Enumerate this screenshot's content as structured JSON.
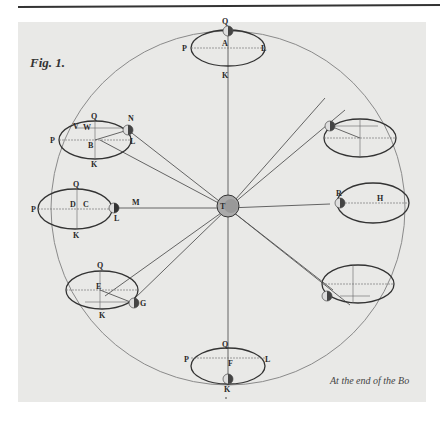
{
  "figure": {
    "label": "Fig. 1.",
    "caption": "At the end of the Bo",
    "earth_label": "T"
  },
  "colors": {
    "paper": "#e9e9e7",
    "ink": "#333333",
    "orbit": "#8a8a8a"
  },
  "positions": {
    "top": {
      "Q": "Q",
      "P": "P",
      "A": "A",
      "L": "L",
      "K": "K"
    },
    "upper_left": {
      "Q": "Q",
      "N": "N",
      "W": "W",
      "P": "P",
      "B": "B",
      "L": "L",
      "K": "K",
      "V": "V"
    },
    "left": {
      "Q": "Q",
      "P": "P",
      "D": "D",
      "C": "C",
      "L": "L",
      "M": "M",
      "K": "K"
    },
    "lower_left": {
      "Q": "Q",
      "E": "E",
      "G": "G",
      "K": "K"
    },
    "bottom": {
      "Q": "Q",
      "P": "P",
      "F": "F",
      "L": "L",
      "K": "K"
    },
    "right": {
      "R": "R",
      "H": "H"
    }
  }
}
